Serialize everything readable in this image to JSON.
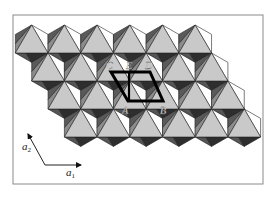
{
  "figure": {
    "frame": {
      "x": 13,
      "y": 15,
      "width": 250,
      "height": 169
    },
    "layer": {
      "rows": 4,
      "per_row": 6,
      "origin_x": 31.7,
      "origin_y": 25,
      "spacing_x": 32.7,
      "row_shift_x": 16.35,
      "row_spacing_y": 28,
      "half_width": 16.35,
      "upper_side_dy": 9.4,
      "lower_side_dy": 28,
      "bottom_dy": 37.4
    },
    "colors": {
      "top_face": "#c9c9c9",
      "left_face_upper": "#5a5a5a",
      "left_face_lower": "#8c8c8c",
      "right_face": "#ffffff",
      "bottom_face": "#2e2e2e",
      "bottom_face_left": "#555555",
      "edge": "#222222",
      "frame": "#8a8a8a",
      "cell": "#000000"
    },
    "unit_cell": {
      "points": [
        [
          111,
          72
        ],
        [
          150,
          72
        ],
        [
          163,
          101
        ],
        [
          128,
          101
        ]
      ],
      "divider": [
        [
          129,
          72
        ],
        [
          129,
          101
        ]
      ],
      "labels": [
        {
          "text": "C",
          "x": 106,
          "y": 69
        },
        {
          "text": "E",
          "x": 126,
          "y": 69
        },
        {
          "text": "D",
          "x": 145,
          "y": 69
        },
        {
          "text": "A",
          "x": 122,
          "y": 114
        },
        {
          "text": "B",
          "x": 160,
          "y": 114
        }
      ]
    },
    "axes": {
      "origin": [
        45,
        165
      ],
      "a1_end": [
        81,
        165
      ],
      "a2_end": [
        28,
        134
      ],
      "a1_label": "a",
      "a1_sub": "1",
      "a2_label": "a",
      "a2_sub": "2",
      "a1_label_pos": [
        66,
        176
      ],
      "a2_label_pos": [
        22,
        150
      ]
    }
  }
}
